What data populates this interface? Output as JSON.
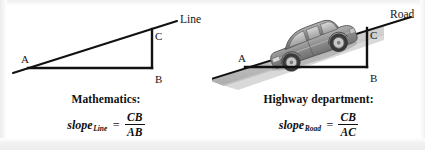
{
  "figure": {
    "background_color": "#ffffff",
    "ink_color": "#111111"
  },
  "panels": [
    {
      "id": "mathematics",
      "diagram": {
        "ray_label": "Line",
        "vertices": [
          {
            "name": "A",
            "label": "A"
          },
          {
            "name": "B",
            "label": "B"
          },
          {
            "name": "C",
            "label": "C"
          }
        ],
        "has_car": false
      },
      "caption": "Mathematics:",
      "formula": {
        "subject": "slope",
        "subscript": "Line",
        "equals": "=",
        "numerator": "CB",
        "denominator": "AB"
      }
    },
    {
      "id": "highway-department",
      "diagram": {
        "ray_label": "Road",
        "vertices": [
          {
            "name": "A",
            "label": "A"
          },
          {
            "name": "B",
            "label": "B"
          },
          {
            "name": "C",
            "label": "C"
          }
        ],
        "has_car": true,
        "car": {
          "name": "sedan",
          "body_color": "#8e8e8e",
          "shadow_color": "#b9b9b9"
        }
      },
      "caption": "Highway department:",
      "formula": {
        "subject": "slope",
        "subscript": "Road",
        "equals": "=",
        "numerator": "CB",
        "denominator": "AC"
      }
    }
  ]
}
